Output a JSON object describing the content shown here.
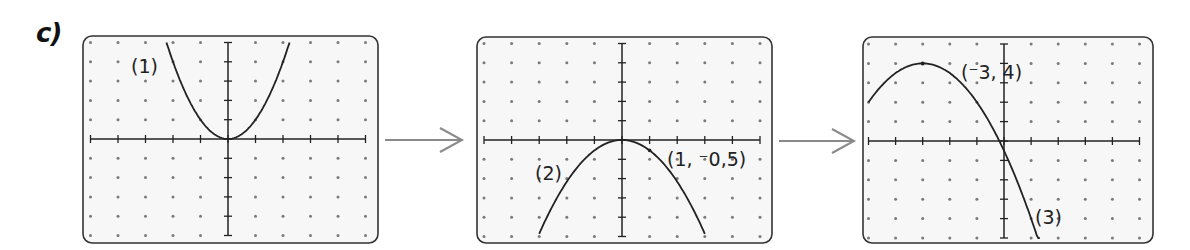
{
  "part_label": "c)",
  "colors": {
    "panel_fill": "#f7f7f7",
    "panel_border": "#333333",
    "dot": "#7a7a7a",
    "axis": "#222222",
    "curve": "#222222",
    "arrow": "#8a8a8a"
  },
  "graphs": [
    {
      "name": "graph-1",
      "label": "(1)",
      "function": "y = x^2",
      "vertex": [
        0,
        0
      ],
      "x_range": [
        -5,
        5
      ],
      "y_range": [
        -5,
        5
      ]
    },
    {
      "name": "graph-2",
      "label": "(2)",
      "function": "y = -0.5x^2",
      "vertex": [
        0,
        0
      ],
      "point_label": "(1, ⁻0,5)",
      "point": [
        1,
        -0.5
      ],
      "x_range": [
        -5,
        5
      ],
      "y_range": [
        -5,
        5
      ]
    },
    {
      "name": "graph-3",
      "label": "(3)",
      "function": "y = -0.5(x+3)^2 + 4",
      "vertex": [
        -3,
        4
      ],
      "point_label": "(⁻3, 4)",
      "point": [
        -3,
        4
      ],
      "x_range": [
        -5,
        5
      ],
      "y_range": [
        -5,
        5
      ]
    }
  ],
  "arrows": [
    {
      "name": "arrow-1-to-2"
    },
    {
      "name": "arrow-2-to-3"
    }
  ]
}
